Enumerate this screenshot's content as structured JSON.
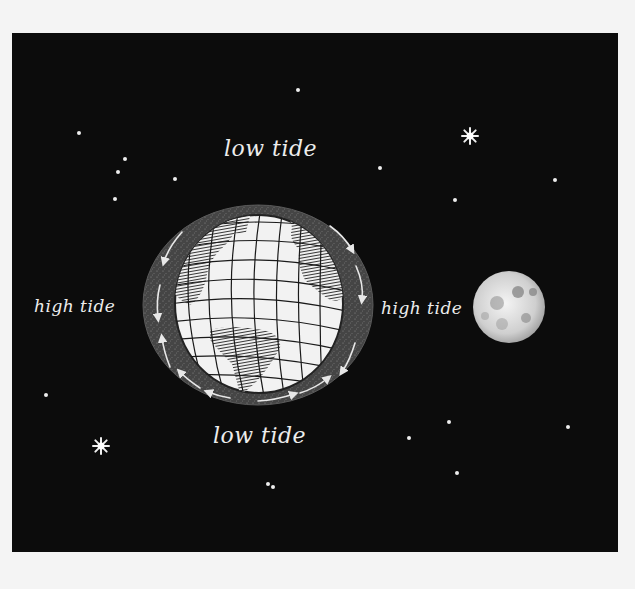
{
  "diagram": {
    "labels": {
      "top": "low tide",
      "bottom": "low tide",
      "left": "high tide",
      "right": "high tide"
    },
    "objects": {
      "earth": {
        "name": "Earth",
        "cx": 258,
        "cy": 305,
        "ring_rx": 115,
        "ring_ry": 100,
        "globe_r": 88
      },
      "moon": {
        "name": "Moon",
        "cx": 509,
        "cy": 307,
        "r": 36
      }
    },
    "colors": {
      "background": "#0c0c0c",
      "page": "#f4f4f4",
      "ocean_bulge": "#4a4a4a",
      "globe": "#f2f2f2",
      "land": "#3a3a3a",
      "text": "#ededed",
      "moon": "#d8d8d8"
    },
    "stars": [
      {
        "x": 298,
        "y": 90,
        "size": "small"
      },
      {
        "x": 79,
        "y": 133,
        "size": "small"
      },
      {
        "x": 125,
        "y": 159,
        "size": "small"
      },
      {
        "x": 118,
        "y": 172,
        "size": "small"
      },
      {
        "x": 175,
        "y": 179,
        "size": "small"
      },
      {
        "x": 115,
        "y": 199,
        "size": "small"
      },
      {
        "x": 380,
        "y": 168,
        "size": "small"
      },
      {
        "x": 470,
        "y": 136,
        "size": "large"
      },
      {
        "x": 555,
        "y": 180,
        "size": "small"
      },
      {
        "x": 455,
        "y": 200,
        "size": "small"
      },
      {
        "x": 46,
        "y": 395,
        "size": "small"
      },
      {
        "x": 101,
        "y": 446,
        "size": "large"
      },
      {
        "x": 409,
        "y": 438,
        "size": "small"
      },
      {
        "x": 449,
        "y": 422,
        "size": "small"
      },
      {
        "x": 457,
        "y": 473,
        "size": "small"
      },
      {
        "x": 568,
        "y": 427,
        "size": "small"
      },
      {
        "x": 268,
        "y": 484,
        "size": "small"
      },
      {
        "x": 273,
        "y": 487,
        "size": "small"
      }
    ]
  }
}
